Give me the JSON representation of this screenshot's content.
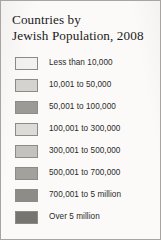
{
  "legend": {
    "title_line_1": "Countries by",
    "title_line_2": "Jewish Population, 2008",
    "border_color": "#a8a5a0",
    "background_color": "#fbfaf8",
    "entries": [
      {
        "label": "Less than 10,000",
        "swatch_color": "#f2f1ef"
      },
      {
        "label": "10,001 to 50,000",
        "swatch_color": "#d4d3d0"
      },
      {
        "label": "50,001 to 100,000",
        "swatch_color": "#9b9a97"
      },
      {
        "label": "100,001 to 300,000",
        "swatch_color": "#dcdbd8"
      },
      {
        "label": "300,001 to 500,000",
        "swatch_color": "#c3c2bf"
      },
      {
        "label": "500,001 to 700,000",
        "swatch_color": "#a2a19e"
      },
      {
        "label": "700,001 to 5 million",
        "swatch_color": "#8d8c89"
      },
      {
        "label": "Over 5 million",
        "swatch_color": "#76756f"
      }
    ]
  }
}
